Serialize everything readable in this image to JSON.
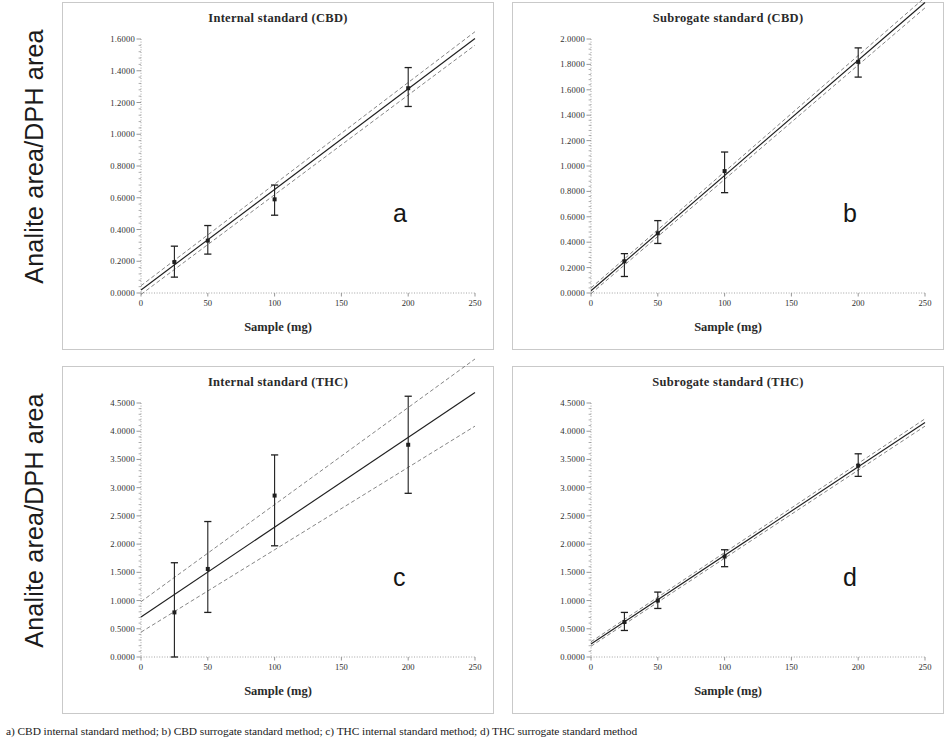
{
  "figure": {
    "ylabel_top": "Analite area/DPH area",
    "ylabel_bottom": "Analite area/DPH area",
    "caption": "a) CBD internal standard method; b) CBD surrogate standard method; c) THC internal standard method; d) THC surrogate standard method"
  },
  "chart_data": [
    {
      "type": "scatter",
      "panel": "a",
      "title": "Internal standard (CBD)",
      "xlabel": "Sample (mg)",
      "ylabel": "Analite area/DPH area",
      "xlim": [
        0,
        250
      ],
      "ylim": [
        0,
        1.6
      ],
      "xticks": [
        "0",
        "50",
        "100",
        "150",
        "200",
        "250"
      ],
      "yticks": [
        "0.0000",
        "0.2000",
        "0.4000",
        "0.6000",
        "0.8000",
        "1.0000",
        "1.2000",
        "1.4000",
        "1.6000"
      ],
      "grid": false,
      "legend": "none",
      "x": [
        25,
        50,
        100,
        200
      ],
      "values": [
        0.195,
        0.33,
        0.59,
        1.29
      ],
      "err_low": [
        0.1,
        0.245,
        0.49,
        1.175
      ],
      "err_high": [
        0.295,
        0.425,
        0.68,
        1.42
      ],
      "fit_line": {
        "slope": 0.00634,
        "intercept": 0.0185
      },
      "ci_upper": {
        "slope": 0.0064,
        "intercept": 0.046
      },
      "ci_lower": {
        "slope": 0.00628,
        "intercept": -0.009
      }
    },
    {
      "type": "scatter",
      "panel": "b",
      "title": "Subrogate standard (CBD)",
      "xlabel": "Sample (mg)",
      "ylabel": "Analite area/DPH area",
      "xlim": [
        0,
        250
      ],
      "ylim": [
        0,
        2.0
      ],
      "xticks": [
        "0",
        "50",
        "100",
        "150",
        "200",
        "250"
      ],
      "yticks": [
        "0.0000",
        "0.2000",
        "0.4000",
        "0.6000",
        "0.8000",
        "1.0000",
        "1.2000",
        "1.4000",
        "1.6000",
        "1.8000",
        "2.0000"
      ],
      "grid": false,
      "legend": "none",
      "x": [
        25,
        50,
        100,
        200
      ],
      "values": [
        0.25,
        0.47,
        0.96,
        1.82
      ],
      "err_low": [
        0.13,
        0.39,
        0.79,
        1.7
      ],
      "err_high": [
        0.31,
        0.57,
        1.11,
        1.93
      ],
      "fit_line": {
        "slope": 0.00908,
        "intercept": 0.0175
      },
      "ci_upper": {
        "slope": 0.00915,
        "intercept": 0.04
      },
      "ci_lower": {
        "slope": 0.009,
        "intercept": -0.005
      }
    },
    {
      "type": "scatter",
      "panel": "c",
      "title": "Internal standard (THC)",
      "xlabel": "Sample (mg)",
      "ylabel": "Analite area/DPH area",
      "xlim": [
        0,
        250
      ],
      "ylim": [
        0,
        4.5
      ],
      "xticks": [
        "0",
        "50",
        "100",
        "150",
        "200",
        "250"
      ],
      "yticks": [
        "0.0000",
        "0.5000",
        "1.0000",
        "1.5000",
        "2.0000",
        "2.5000",
        "3.0000",
        "3.5000",
        "4.0000",
        "4.5000"
      ],
      "grid": false,
      "legend": "none",
      "x": [
        25,
        50,
        100,
        200
      ],
      "values": [
        0.79,
        1.56,
        2.86,
        3.76
      ],
      "err_low": [
        0.0,
        0.79,
        1.97,
        2.9
      ],
      "err_high": [
        1.67,
        2.4,
        3.58,
        4.62
      ],
      "fit_line": {
        "slope": 0.0159,
        "intercept": 0.71
      },
      "ci_upper": {
        "slope": 0.0172,
        "intercept": 0.98
      },
      "ci_lower": {
        "slope": 0.0146,
        "intercept": 0.44
      }
    },
    {
      "type": "scatter",
      "panel": "d",
      "title": "Subrogate standard (THC)",
      "xlabel": "Sample (mg)",
      "ylabel": "Analite area/DPH area",
      "xlim": [
        0,
        250
      ],
      "ylim": [
        0,
        4.5
      ],
      "xticks": [
        "0",
        "50",
        "100",
        "150",
        "200",
        "250"
      ],
      "yticks": [
        "0.0000",
        "0.5000",
        "1.0000",
        "1.5000",
        "2.0000",
        "2.5000",
        "3.0000",
        "3.5000",
        "4.0000",
        "4.5000"
      ],
      "grid": false,
      "legend": "none",
      "x": [
        25,
        50,
        100,
        200
      ],
      "values": [
        0.62,
        1.0,
        1.78,
        3.39
      ],
      "err_low": [
        0.47,
        0.86,
        1.6,
        3.2
      ],
      "err_high": [
        0.79,
        1.15,
        1.9,
        3.6
      ],
      "fit_line": {
        "slope": 0.0157,
        "intercept": 0.23
      },
      "ci_upper": {
        "slope": 0.0158,
        "intercept": 0.27
      },
      "ci_lower": {
        "slope": 0.0156,
        "intercept": 0.19
      }
    }
  ],
  "panels": [
    {
      "letter": "a"
    },
    {
      "letter": "b"
    },
    {
      "letter": "c"
    },
    {
      "letter": "d"
    }
  ]
}
